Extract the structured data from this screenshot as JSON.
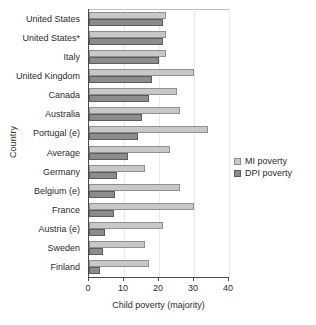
{
  "chart_data": {
    "type": "bar",
    "orientation": "horizontal",
    "title": "",
    "xlabel": "Child poverty (majority)",
    "ylabel": "Country",
    "xlim": [
      0,
      40
    ],
    "xticks": [
      0,
      10,
      20,
      30,
      40
    ],
    "xtick_labels": [
      "0",
      "10",
      "20",
      "30",
      "40"
    ],
    "grid": true,
    "legend_position": "right",
    "categories": [
      "United States",
      "United States*",
      "Italy",
      "United Kingdom",
      "Canada",
      "Australia",
      "Portugal (e)",
      "Average",
      "Germany",
      "Belgium (e)",
      "France",
      "Austria (e)",
      "Sweden",
      "Finland"
    ],
    "series": [
      {
        "name": "MI poverty",
        "color": "#c8c8c8",
        "values": [
          22.0,
          22.0,
          22.0,
          30.0,
          25.0,
          26.0,
          34.0,
          23.0,
          16.0,
          26.0,
          30.0,
          21.0,
          16.0,
          17.0
        ]
      },
      {
        "name": "DPI poverty",
        "color": "#8c8c8c",
        "values": [
          21.0,
          21.0,
          20.0,
          18.0,
          17.0,
          15.0,
          14.0,
          11.0,
          8.0,
          7.5,
          7.0,
          4.5,
          4.0,
          3.0
        ]
      }
    ]
  },
  "legend": {
    "items": [
      {
        "label": "MI poverty"
      },
      {
        "label": "DPI poverty"
      }
    ]
  }
}
